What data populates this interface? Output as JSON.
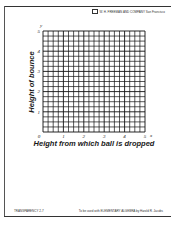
{
  "header": {
    "publisher": "W. H. FREEMAN AND COMPANY  San Francisco"
  },
  "footer": {
    "left": "TRANSPARENCY 2-7",
    "right": "To be used with ELEMENTARY ALGEBRA by Harold R. Jacobs"
  },
  "chart_data": {
    "type": "scatter",
    "title": "",
    "xlabel": "Height from which ball is dropped",
    "ylabel": "Height of bounce",
    "x_axis_letter": "x",
    "y_axis_letter": "y",
    "xlim": [
      0,
      5
    ],
    "ylim": [
      0,
      5
    ],
    "x_ticks": [
      "0",
      "1",
      "2",
      "3",
      "4",
      "5"
    ],
    "y_ticks": [
      "0",
      "1",
      "2",
      "3",
      "4",
      "5"
    ],
    "grid": true,
    "minor_divisions_per_unit": 4,
    "series": [],
    "x": [],
    "values": []
  }
}
